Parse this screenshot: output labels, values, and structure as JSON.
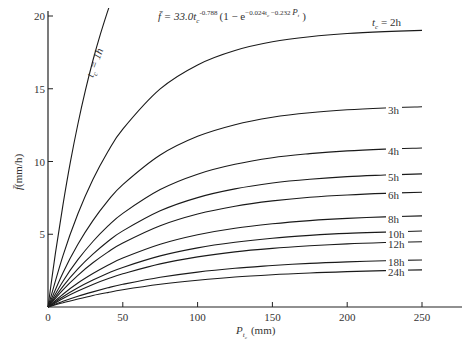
{
  "chart_data": {
    "type": "line",
    "title_parts": {
      "lhs": "f̄ = 33.0",
      "t": "t",
      "sub_c": "c",
      "exp1": "-0.788",
      "paren_open": "(1 − e",
      "exp2": "−0.024t",
      "exp2_sub": "c",
      "exp2_rest": " −0.232 ",
      "exp2_P": "P",
      "exp2_Psub": "t",
      "paren_close": ")"
    },
    "xlabel": "P_tc (mm)",
    "xlabel_parts": {
      "P": "P",
      "sub": "t",
      "subsub": "c",
      "unit": "(mm)"
    },
    "ylabel": "f̄(mm/h)",
    "ylabel_parts": {
      "f": "f̄",
      "unit": "(mm/h)"
    },
    "xlim": [
      0,
      250
    ],
    "ylim": [
      0,
      20
    ],
    "xticks": [
      0,
      50,
      100,
      150,
      200,
      250
    ],
    "yticks": [
      5,
      10,
      15,
      20
    ],
    "grid": false,
    "legend_position": "inline labels at right end of curves",
    "series": [
      {
        "name": "t_c = 1h",
        "label": "t",
        "label_sub": "c",
        "label_rest": " = 1h",
        "t": 1,
        "x": [
          0,
          5,
          10,
          15,
          20,
          25,
          30,
          35,
          40,
          42
        ],
        "y": [
          0,
          3.73,
          7.04,
          9.97,
          12.58,
          14.89,
          16.94,
          18.75,
          20.36,
          20.96
        ]
      },
      {
        "name": "t_c = 2h",
        "label": "t",
        "label_sub": "c",
        "label_rest": " = 2h",
        "t": 2,
        "x": [
          0,
          10,
          20,
          30,
          40,
          50,
          75,
          100,
          125,
          150,
          175,
          200,
          225,
          250
        ],
        "y": [
          0,
          3.53,
          6.41,
          8.76,
          10.67,
          12.23,
          14.99,
          16.64,
          17.63,
          18.23,
          18.58,
          18.8,
          18.93,
          19.01
        ]
      },
      {
        "name": "3h",
        "label": "3h",
        "t": 3,
        "x": [
          0,
          10,
          20,
          30,
          40,
          50,
          75,
          100,
          125,
          150,
          175,
          200,
          225,
          250
        ],
        "y": [
          0,
          2.36,
          4.31,
          5.94,
          7.29,
          8.41,
          10.45,
          11.73,
          12.53,
          13.04,
          13.35,
          13.55,
          13.68,
          13.76
        ]
      },
      {
        "name": "4h",
        "label": "4h",
        "t": 4,
        "x": [
          0,
          10,
          20,
          30,
          40,
          50,
          75,
          100,
          125,
          150,
          175,
          200,
          225,
          250
        ],
        "y": [
          0,
          1.77,
          3.25,
          4.5,
          5.55,
          6.43,
          8.07,
          9.13,
          9.81,
          10.26,
          10.54,
          10.73,
          10.85,
          10.93
        ]
      },
      {
        "name": "5h",
        "label": "5h",
        "t": 5,
        "x": [
          0,
          10,
          20,
          30,
          40,
          50,
          75,
          100,
          125,
          150,
          175,
          200,
          225,
          250
        ],
        "y": [
          0,
          1.42,
          2.62,
          3.63,
          4.5,
          5.23,
          6.61,
          7.52,
          8.12,
          8.52,
          8.78,
          8.96,
          9.07,
          9.15
        ]
      },
      {
        "name": "6h",
        "label": "6h",
        "t": 6,
        "x": [
          0,
          10,
          20,
          30,
          40,
          50,
          75,
          100,
          125,
          150,
          175,
          200,
          225,
          250
        ],
        "y": [
          0,
          1.18,
          2.18,
          3.04,
          3.77,
          4.4,
          5.59,
          6.39,
          6.93,
          7.29,
          7.54,
          7.7,
          7.81,
          7.89
        ]
      },
      {
        "name": "8h",
        "label": "8h",
        "t": 8,
        "x": [
          0,
          10,
          20,
          30,
          40,
          50,
          75,
          100,
          125,
          150,
          175,
          200,
          225,
          250
        ],
        "y": [
          0,
          0.88,
          1.65,
          2.3,
          2.87,
          3.36,
          4.31,
          4.96,
          5.41,
          5.72,
          5.94,
          6.09,
          6.19,
          6.26
        ]
      },
      {
        "name": "10h",
        "label": "10h",
        "t": 10,
        "x": [
          0,
          10,
          20,
          30,
          40,
          50,
          75,
          100,
          125,
          150,
          175,
          200,
          225,
          250
        ],
        "y": [
          0,
          0.71,
          1.32,
          1.85,
          2.32,
          2.72,
          3.51,
          4.06,
          4.45,
          4.73,
          4.92,
          5.06,
          5.15,
          5.22
        ]
      },
      {
        "name": "12h",
        "label": "12h",
        "t": 12,
        "x": [
          0,
          10,
          20,
          30,
          40,
          50,
          75,
          100,
          125,
          150,
          175,
          200,
          225,
          250
        ],
        "y": [
          0,
          0.59,
          1.1,
          1.55,
          1.94,
          2.28,
          2.96,
          3.44,
          3.79,
          4.03,
          4.21,
          4.34,
          4.43,
          4.49
        ]
      },
      {
        "name": "18h",
        "label": "18h",
        "t": 18,
        "x": [
          0,
          10,
          20,
          30,
          40,
          50,
          75,
          100,
          125,
          150,
          175,
          200,
          225,
          250
        ],
        "y": [
          0,
          0.39,
          0.74,
          1.04,
          1.32,
          1.56,
          2.04,
          2.4,
          2.66,
          2.85,
          3.0,
          3.1,
          3.18,
          3.23
        ]
      },
      {
        "name": "24h",
        "label": "24h",
        "t": 24,
        "x": [
          0,
          10,
          20,
          30,
          40,
          50,
          75,
          100,
          125,
          150,
          175,
          200,
          225,
          250
        ],
        "y": [
          0,
          0.29,
          0.55,
          0.79,
          0.99,
          1.18,
          1.56,
          1.84,
          2.06,
          2.22,
          2.34,
          2.43,
          2.5,
          2.55
        ]
      }
    ]
  },
  "style": {
    "line_color": "#1a1a1a",
    "axis_color": "#222222",
    "text_color": "#333333",
    "background": "#ffffff"
  }
}
